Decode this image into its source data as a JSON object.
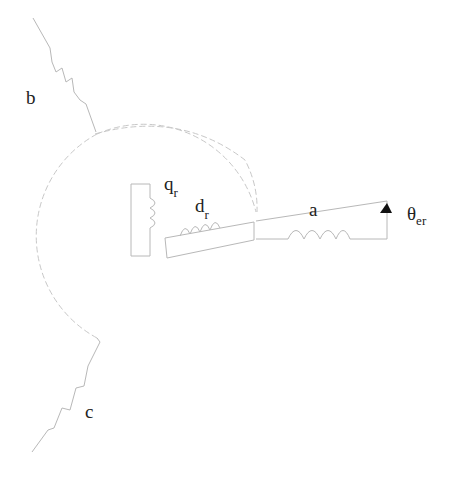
{
  "diagram": {
    "type": "electrical-machine-winding-diagram",
    "stator_windings": [
      {
        "id": "a",
        "label": "a"
      },
      {
        "id": "b",
        "label": "b"
      },
      {
        "id": "c",
        "label": "c"
      }
    ],
    "rotor_windings": [
      {
        "id": "qr",
        "label": "q",
        "subscript": "r"
      },
      {
        "id": "dr",
        "label": "d",
        "subscript": "r"
      }
    ],
    "angle": {
      "label": "θ",
      "subscript": "er"
    },
    "colors": {
      "lines": "#b8b8b8",
      "text": "#222222",
      "arrow": "#111111"
    }
  }
}
